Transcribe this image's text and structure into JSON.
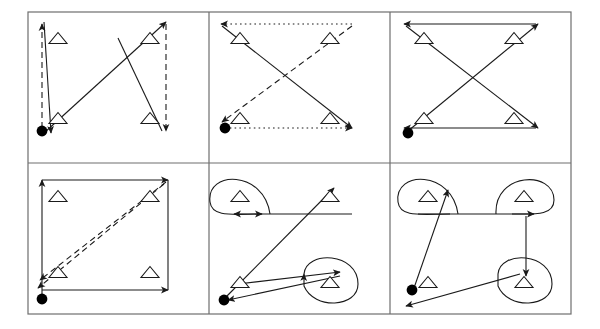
{
  "figure": {
    "type": "diagram",
    "canvas": {
      "width": 600,
      "height": 329,
      "background": "#ffffff"
    },
    "style": {
      "stroke": "#1a1a1a",
      "grid_border": "#6e6e6e",
      "line_width": 1.1,
      "border_width": 1.2,
      "node_fill": "#000000",
      "triangle_fill": "#ffffff"
    },
    "grid": {
      "rows": 2,
      "cols": 3,
      "x0": 28,
      "y0": 12,
      "cell_w": 181,
      "cell_h": 151
    },
    "legend": {
      "start_node": "filled-circle",
      "waypoint": "open-triangle",
      "edge_styles": [
        "solid",
        "dashed",
        "dotted"
      ]
    },
    "panels": [
      {
        "id": "panel-1",
        "index": 1,
        "row": 0,
        "col": 0,
        "triangles": [
          [
            58,
            38
          ],
          [
            150,
            38
          ],
          [
            58,
            118
          ],
          [
            150,
            118
          ]
        ],
        "start": [
          42,
          131
        ],
        "edges": [
          {
            "from": [
              42,
              128
            ],
            "to": [
              42,
              24
            ],
            "style": "dashed",
            "arrow": "end"
          },
          {
            "from": [
              44,
              22
            ],
            "to": [
              51,
              133
            ],
            "style": "solid",
            "arrow": "end"
          },
          {
            "from": [
              44,
              133
            ],
            "to": [
              166,
              22
            ],
            "style": "solid",
            "arrow": "end"
          },
          {
            "from": [
              166,
              24
            ],
            "to": [
              166,
              131
            ],
            "style": "dashed",
            "arrow": "end"
          },
          {
            "from": [
              162,
              131
            ],
            "to": [
              118,
              38
            ],
            "style": "solid",
            "arrow": "none"
          }
        ]
      },
      {
        "id": "panel-2",
        "index": 2,
        "row": 0,
        "col": 1,
        "triangles": [
          [
            240,
            38
          ],
          [
            330,
            38
          ],
          [
            240,
            118
          ],
          [
            330,
            118
          ]
        ],
        "start": [
          225,
          128
        ],
        "edges": [
          {
            "from": [
              352,
              24
            ],
            "to": [
              221,
              24
            ],
            "style": "dotted",
            "arrow": "end"
          },
          {
            "from": [
              222,
              26
            ],
            "to": [
              352,
              128
            ],
            "style": "solid",
            "arrow": "end"
          },
          {
            "from": [
              225,
              128
            ],
            "to": [
              352,
              128
            ],
            "style": "dotted",
            "arrow": "end"
          },
          {
            "from": [
              352,
              26
            ],
            "to": [
              222,
              122
            ],
            "style": "dashed",
            "arrow": "end"
          }
        ]
      },
      {
        "id": "panel-3",
        "index": 3,
        "row": 0,
        "col": 2,
        "triangles": [
          [
            424,
            38
          ],
          [
            514,
            38
          ],
          [
            424,
            118
          ],
          [
            514,
            118
          ]
        ],
        "start": [
          408,
          133
        ],
        "edges": [
          {
            "from": [
              536,
              24
            ],
            "to": [
              404,
              24
            ],
            "style": "solid",
            "arrow": "end"
          },
          {
            "from": [
              406,
              26
            ],
            "to": [
              538,
              128
            ],
            "style": "solid",
            "arrow": "end"
          },
          {
            "from": [
              536,
              128
            ],
            "to": [
              404,
              128
            ],
            "style": "solid",
            "arrow": "end"
          },
          {
            "from": [
              408,
              131
            ],
            "to": [
              538,
              24
            ],
            "style": "solid",
            "arrow": "end"
          }
        ]
      },
      {
        "id": "panel-4",
        "index": 4,
        "row": 1,
        "col": 0,
        "triangles": [
          [
            58,
            196
          ],
          [
            150,
            196
          ],
          [
            58,
            272
          ],
          [
            150,
            272
          ]
        ],
        "start": [
          42,
          299
        ],
        "edges": [
          {
            "from": [
              42,
              296
            ],
            "to": [
              42,
              180
            ],
            "style": "solid",
            "arrow": "end"
          },
          {
            "from": [
              42,
              180
            ],
            "to": [
              168,
              180
            ],
            "style": "solid",
            "arrow": "end"
          },
          {
            "from": [
              168,
              180
            ],
            "to": [
              168,
              290
            ],
            "style": "solid",
            "arrow": "none"
          },
          {
            "from": [
              42,
              290
            ],
            "to": [
              168,
              290
            ],
            "style": "solid",
            "arrow": "end"
          },
          {
            "from": [
              166,
              182
            ],
            "to": [
              40,
              280
            ],
            "style": "dashed",
            "arrow": "end"
          },
          {
            "from": [
              164,
              184
            ],
            "to": [
              38,
              288
            ],
            "style": "dashed",
            "arrow": "end"
          }
        ]
      },
      {
        "id": "panel-5",
        "index": 5,
        "row": 1,
        "col": 1,
        "triangles": [
          [
            240,
            196
          ],
          [
            330,
            196
          ],
          [
            240,
            282
          ],
          [
            330,
            282
          ]
        ],
        "start": [
          224,
          300
        ],
        "edges": [
          {
            "from": [
              352,
              214
            ],
            "to": [
              234,
              214
            ],
            "style": "solid",
            "arrow": "end"
          },
          {
            "from": [
              226,
              297
            ],
            "to": [
              334,
              188
            ],
            "style": "solid",
            "arrow": "end"
          },
          {
            "from": [
              238,
              284
            ],
            "to": [
              340,
              272
            ],
            "style": "solid",
            "arrow": "end"
          },
          {
            "from": [
              340,
              276
            ],
            "to": [
              228,
              300
            ],
            "style": "solid",
            "arrow": "end"
          }
        ],
        "loops": [
          {
            "around": [
              240,
              196
            ],
            "side": "top-left",
            "arrow": "end"
          },
          {
            "around": [
              330,
              282
            ],
            "side": "bottom-right",
            "arrow": "end"
          }
        ]
      },
      {
        "id": "panel-6",
        "index": 6,
        "row": 1,
        "col": 2,
        "triangles": [
          [
            428,
            196
          ],
          [
            524,
            196
          ],
          [
            428,
            282
          ],
          [
            524,
            282
          ]
        ],
        "start": [
          412,
          290
        ],
        "edges": [
          {
            "from": [
              414,
              288
            ],
            "to": [
              448,
              190
            ],
            "style": "solid",
            "arrow": "end"
          },
          {
            "from": [
              418,
              214
            ],
            "to": [
              534,
              214
            ],
            "style": "solid",
            "arrow": "end"
          },
          {
            "from": [
              526,
              216
            ],
            "to": [
              526,
              276
            ],
            "style": "solid",
            "arrow": "end"
          },
          {
            "from": [
              520,
              274
            ],
            "to": [
              406,
              306
            ],
            "style": "solid",
            "arrow": "end"
          }
        ],
        "loops": [
          {
            "around": [
              428,
              196
            ],
            "side": "top-left",
            "arrow": "none"
          },
          {
            "around": [
              524,
              196
            ],
            "side": "top-right",
            "arrow": "none"
          },
          {
            "around": [
              524,
              282
            ],
            "side": "bottom-right",
            "arrow": "none"
          }
        ]
      }
    ]
  }
}
